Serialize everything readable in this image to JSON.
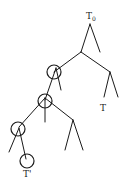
{
  "diagram": {
    "type": "tree",
    "labels": {
      "root": "T",
      "root_sub": "0",
      "subtree": "T",
      "leaf_subtree": "T'"
    },
    "colors": {
      "stroke": "#1a1a1a",
      "text": "#222222",
      "background": "#ffffff"
    },
    "nodes": [
      {
        "id": "root",
        "x": 90,
        "y": 24,
        "label": "T0"
      },
      {
        "id": "n1",
        "x": 81,
        "y": 52
      },
      {
        "id": "n1r",
        "x": 100,
        "y": 52
      },
      {
        "id": "c1",
        "x": 54,
        "y": 72,
        "circled": true
      },
      {
        "id": "n2",
        "x": 110,
        "y": 72
      },
      {
        "id": "c2",
        "x": 45,
        "y": 100,
        "circled": true
      },
      {
        "id": "c3",
        "x": 19,
        "y": 127,
        "circled": true
      },
      {
        "id": "c4",
        "x": 27,
        "y": 161,
        "circled": true,
        "label": "T'"
      },
      {
        "id": "t",
        "x": 104,
        "y": 100,
        "label": "T"
      }
    ]
  }
}
